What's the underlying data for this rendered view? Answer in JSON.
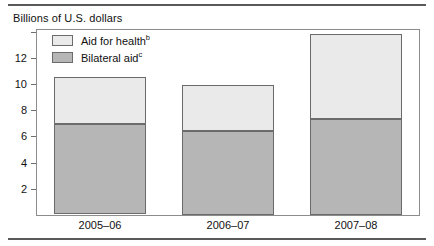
{
  "figure": {
    "axis_title": "Billions of U.S. dollars"
  },
  "legend": {
    "items": [
      {
        "label": "Aid for health",
        "note": "b",
        "color": "#eaeaea",
        "name": "aid-for-health"
      },
      {
        "label": "Bilateral aid",
        "note": "c",
        "color": "#b6b6b6",
        "name": "bilateral-aid"
      }
    ]
  },
  "chart_data": {
    "type": "bar",
    "stacked": true,
    "title": "",
    "ylabel": "Billions of U.S. dollars",
    "xlabel": "",
    "categories": [
      "2005–06",
      "2006–07",
      "2007–08"
    ],
    "series": [
      {
        "name": "Bilateral aid",
        "note": "c",
        "color": "#b6b6b6",
        "values": [
          6.9,
          6.4,
          7.3
        ]
      },
      {
        "name": "Aid for health",
        "note": "b",
        "color": "#eaeaea",
        "values": [
          3.6,
          3.5,
          6.5
        ]
      }
    ],
    "totals": [
      10.5,
      9.9,
      13.8
    ],
    "ylim": [
      0,
      14.2
    ],
    "yticks": [
      2,
      4,
      6,
      8,
      10,
      12
    ],
    "ytick_labels": [
      "2",
      "4",
      "6",
      "8",
      "10",
      "12"
    ],
    "grid": false,
    "legend_position": "top-left-inside"
  }
}
